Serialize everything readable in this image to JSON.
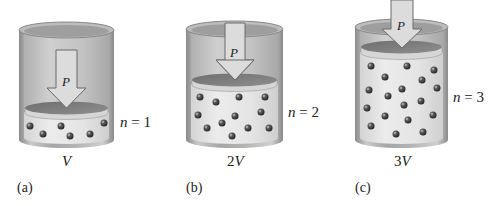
{
  "figure": {
    "pressure_label": "P",
    "panels": [
      {
        "id": "a",
        "panel_label": "(a)",
        "n_var": "n",
        "n_eq": " = ",
        "n_value": "1",
        "volume_coef": "",
        "volume_var": "V",
        "molecule_count": 6
      },
      {
        "id": "b",
        "panel_label": "(b)",
        "n_var": "n",
        "n_eq": " = ",
        "n_value": "2",
        "volume_coef": "2",
        "volume_var": "V",
        "molecule_count": 12
      },
      {
        "id": "c",
        "panel_label": "(c)",
        "n_var": "n",
        "n_eq": " = ",
        "n_value": "3",
        "volume_coef": "3",
        "volume_var": "V",
        "molecule_count": 18
      }
    ]
  },
  "colors": {
    "cylinder_wall": "#9a9a9a",
    "cylinder_inner": "#c8c8c8",
    "gas": "#e6e6e6",
    "piston_top": "#7d7d7d",
    "arrow_fill": "#d9d9d9",
    "molecule": "#3a3a3a"
  }
}
